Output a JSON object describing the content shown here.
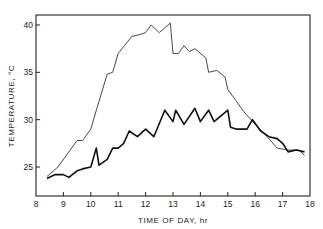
{
  "chart_data": {
    "type": "line",
    "title": "",
    "xlabel": "TIME OF DAY, hr",
    "ylabel": "TEMPERATURE, °C",
    "xlim": [
      8,
      18
    ],
    "ylim": [
      22,
      41.5
    ],
    "xticks": [
      8,
      9,
      10,
      11,
      12,
      13,
      14,
      15,
      16,
      17,
      18
    ],
    "yticks": [
      25,
      30,
      35,
      40
    ],
    "grid": false,
    "legend": null,
    "series": [
      {
        "name": "thin-line",
        "style": "thin",
        "x": [
          8.4,
          8.8,
          9.5,
          9.7,
          10.0,
          10.2,
          10.6,
          10.8,
          11.0,
          11.5,
          11.8,
          12.0,
          12.2,
          12.5,
          12.9,
          13.0,
          13.2,
          13.4,
          13.6,
          13.8,
          14.2,
          14.3,
          14.6,
          14.9,
          15.0,
          15.3,
          15.6,
          16.0,
          16.5,
          16.8,
          17.2,
          17.6,
          17.8
        ],
        "y": [
          24.0,
          25.0,
          27.8,
          27.8,
          29.0,
          31.0,
          34.8,
          35.0,
          37.0,
          38.8,
          39.0,
          39.2,
          40.0,
          39.2,
          40.2,
          37.0,
          37.0,
          37.8,
          37.2,
          37.5,
          36.5,
          35.0,
          35.2,
          34.5,
          33.2,
          32.0,
          30.8,
          29.5,
          28.0,
          27.0,
          26.8,
          26.8,
          26.2
        ]
      },
      {
        "name": "thick-line",
        "style": "thick",
        "x": [
          8.4,
          8.7,
          9.0,
          9.2,
          9.5,
          9.7,
          10.0,
          10.2,
          10.3,
          10.6,
          10.8,
          11.0,
          11.2,
          11.4,
          11.7,
          12.0,
          12.3,
          12.7,
          13.0,
          13.1,
          13.4,
          13.8,
          14.0,
          14.1,
          14.3,
          14.5,
          15.0,
          15.1,
          15.3,
          15.7,
          15.9,
          16.2,
          16.5,
          16.8,
          17.0,
          17.2,
          17.5,
          17.8
        ],
        "y": [
          23.8,
          24.2,
          24.2,
          23.9,
          24.6,
          24.8,
          25.0,
          27.0,
          25.2,
          25.8,
          27.0,
          27.0,
          27.5,
          28.8,
          28.2,
          29.0,
          28.2,
          31.0,
          29.8,
          31.0,
          29.5,
          31.2,
          29.8,
          30.2,
          31.0,
          29.8,
          31.0,
          29.2,
          29.0,
          29.0,
          30.0,
          28.8,
          28.2,
          28.0,
          27.5,
          26.6,
          26.8,
          26.6
        ]
      }
    ]
  }
}
